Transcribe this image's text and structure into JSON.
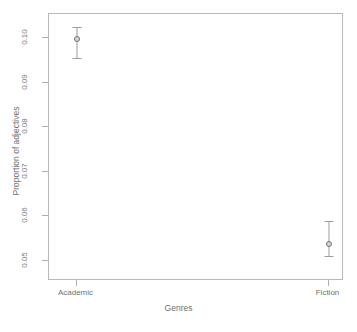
{
  "chart_data": {
    "type": "scatter",
    "title": "",
    "xlabel": "Genres",
    "ylabel": "Proportion of adjectives",
    "categories": [
      "Academic",
      "Fiction"
    ],
    "values": [
      0.0998,
      0.0539
    ],
    "error_low": [
      0.0956,
      0.0512
    ],
    "error_high": [
      0.1026,
      0.0589
    ],
    "series": [
      {
        "name": "Proportion of adjectives",
        "points": [
          {
            "category": "Academic",
            "value": 0.0998,
            "lower": 0.0956,
            "upper": 0.1026
          },
          {
            "category": "Fiction",
            "value": 0.0539,
            "lower": 0.0512,
            "upper": 0.0589
          }
        ]
      }
    ],
    "ylim": [
      0.0455,
      0.1055
    ],
    "yticks": [
      0.05,
      0.06,
      0.07,
      0.08,
      0.09,
      0.1
    ],
    "ytick_labels": [
      "0.05",
      "0.06",
      "0.07",
      "0.08",
      "0.09",
      "0.10"
    ],
    "xtick_labels": [
      "Academic",
      "Fiction"
    ],
    "grid": false,
    "legend": false,
    "marker": "circle-open",
    "colors": {
      "axis": "#b8b8b8",
      "text": "#6f6f6f",
      "point_edge": "#6e6e6e",
      "point_fill": "#d8d8d8",
      "errorbar": "#9c9c9c"
    }
  },
  "axis": {
    "y_label": "Proportion of adjectives",
    "x_label": "Genres",
    "y_ticks": [
      {
        "label": "0.10"
      },
      {
        "label": "0.09"
      },
      {
        "label": "0.08"
      },
      {
        "label": "0.07"
      },
      {
        "label": "0.06"
      },
      {
        "label": "0.05"
      }
    ],
    "x_ticks": [
      {
        "label": "Academic"
      },
      {
        "label": "Fiction"
      }
    ]
  }
}
